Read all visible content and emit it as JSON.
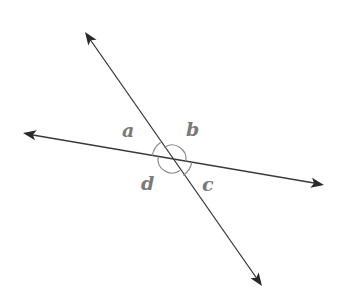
{
  "diagram": {
    "type": "intersecting-lines",
    "colors": {
      "line": "#3a3a3a",
      "arc": "#8a8a8a",
      "label": "#7a7a7a",
      "background": "#ffffff"
    },
    "intersection": {
      "x": 172,
      "y": 159
    },
    "lines": [
      {
        "id": "line-1",
        "from": {
          "x": 85,
          "y": 32
        },
        "to": {
          "x": 262,
          "y": 286
        },
        "arrows": "both"
      },
      {
        "id": "line-2",
        "from": {
          "x": 23,
          "y": 133
        },
        "to": {
          "x": 324,
          "y": 185
        },
        "arrows": "both"
      }
    ],
    "angles": [
      {
        "label": "a",
        "position": "upper-left",
        "x": 122,
        "y": 121
      },
      {
        "label": "b",
        "position": "upper-right",
        "x": 186,
        "y": 120
      },
      {
        "label": "c",
        "position": "lower-right",
        "x": 202,
        "y": 175
      },
      {
        "label": "d",
        "position": "lower-left",
        "x": 141,
        "y": 174
      }
    ]
  }
}
